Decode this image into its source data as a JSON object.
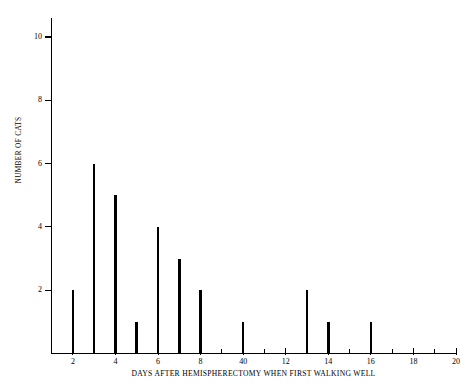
{
  "chart_data": {
    "type": "bar",
    "title": "",
    "subtitle": "",
    "xlabel": "DAYS AFTER HEMISPHERECTOMY WHEN FIRST WALKING WELL",
    "ylabel": "NUMBER OF CATS",
    "xlim": [
      1,
      20
    ],
    "ylim": [
      0,
      10.6
    ],
    "grid": false,
    "legend": "none",
    "style": "spike/needle plot, thin vertical black bars",
    "categories": [
      2,
      3,
      4,
      5,
      6,
      7,
      8,
      10,
      13,
      14,
      16
    ],
    "values": [
      2,
      6,
      5,
      1,
      4,
      3,
      2,
      1,
      2,
      1,
      1
    ],
    "points": [
      {
        "x": 2,
        "y": 2
      },
      {
        "x": 3,
        "y": 6
      },
      {
        "x": 4,
        "y": 5
      },
      {
        "x": 5,
        "y": 1
      },
      {
        "x": 6,
        "y": 4
      },
      {
        "x": 7,
        "y": 3
      },
      {
        "x": 8,
        "y": 2
      },
      {
        "x": 10,
        "y": 1
      },
      {
        "x": 13,
        "y": 2
      },
      {
        "x": 14,
        "y": 1
      },
      {
        "x": 16,
        "y": 1
      }
    ],
    "ytick_values": [
      2,
      4,
      6,
      8,
      10
    ],
    "ytick_labels": [
      "2",
      "4",
      "6",
      "8",
      "10"
    ],
    "xtick_major_values": [
      2,
      4,
      6,
      8,
      10,
      12,
      14,
      16,
      18,
      20
    ],
    "xtick_major_labels": [
      "2",
      "4",
      "6",
      "8",
      "40",
      "12",
      "14",
      "16",
      "18",
      "20"
    ],
    "xtick_minor_values": [
      1,
      3,
      5,
      7,
      9,
      11,
      13,
      15,
      17,
      19
    ],
    "colors": {
      "bar": "#000000",
      "axis": "#000000",
      "background": "#ffffff",
      "text": "#000000"
    },
    "total_cats": 28
  }
}
